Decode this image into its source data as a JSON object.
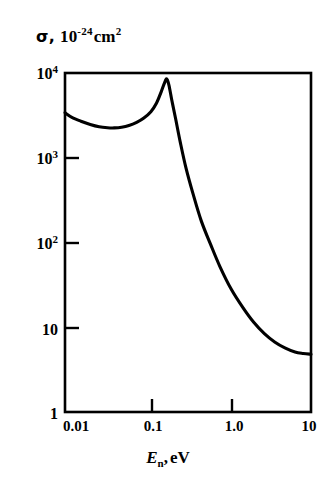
{
  "figure": {
    "background_color": "#ffffff",
    "ink_color": "#000000"
  },
  "axis_titles": {
    "y_symbol": "σ,",
    "y_mantissa": "10",
    "y_exponent": "-24",
    "y_unit": "cm",
    "y_unit_exponent": "2",
    "x_variable": "E",
    "x_subscript": "n",
    "x_separator": ",",
    "x_unit": "eV"
  },
  "y_ticks": [
    {
      "label_mantissa": "10",
      "label_exponent": "4",
      "value": 10000,
      "pixel_y": 73,
      "major": true
    },
    {
      "label_mantissa": "10",
      "label_exponent": "3",
      "value": 1000,
      "pixel_y": 158,
      "major": true
    },
    {
      "label_mantissa": "10",
      "label_exponent": "2",
      "value": 100,
      "pixel_y": 243,
      "major": true
    },
    {
      "label_mantissa": "10",
      "label_exponent": "",
      "value": 10,
      "pixel_y": 328,
      "major": true
    },
    {
      "label_mantissa": "1",
      "label_exponent": "",
      "value": 1,
      "pixel_y": 412,
      "major": true
    }
  ],
  "x_ticks": [
    {
      "label": "0.01",
      "value": 0.01,
      "pixel_x": 72
    },
    {
      "label": "0.1",
      "value": 0.1,
      "pixel_x": 152
    },
    {
      "label": "1.0",
      "value": 1.0,
      "pixel_x": 232
    },
    {
      "label": "10",
      "value": 10,
      "pixel_x": 311
    }
  ],
  "chart_data": {
    "type": "line",
    "title": "",
    "subtitle": "",
    "xlabel": "E_n, eV",
    "ylabel": "σ, 10^-24 cm^2",
    "xscale": "log",
    "yscale": "log",
    "xlim": [
      0.0082,
      10
    ],
    "ylim": [
      1,
      10000
    ],
    "grid": false,
    "legend": false,
    "annotations": [],
    "series": [
      {
        "name": "neutron capture cross section",
        "x": [
          0.0082,
          0.01,
          0.013,
          0.017,
          0.022,
          0.028,
          0.034,
          0.042,
          0.052,
          0.065,
          0.08,
          0.098,
          0.115,
          0.132,
          0.145,
          0.155,
          0.165,
          0.18,
          0.2,
          0.23,
          0.27,
          0.33,
          0.42,
          0.55,
          0.72,
          1.0,
          1.4,
          1.9,
          2.6,
          3.5,
          4.7,
          6.3,
          8.0,
          10.0
        ],
        "y": [
          3400,
          3000,
          2700,
          2470,
          2320,
          2260,
          2250,
          2290,
          2400,
          2620,
          2950,
          3500,
          4400,
          6000,
          7600,
          8500,
          7200,
          4700,
          2900,
          1500,
          760,
          380,
          180,
          95,
          52,
          28,
          17,
          11.5,
          8.4,
          6.7,
          5.7,
          5.1,
          4.9,
          4.8
        ]
      }
    ]
  },
  "plot_frame": {
    "left": 65,
    "right": 311,
    "top": 73,
    "bottom": 412,
    "border_width": 2.6
  }
}
